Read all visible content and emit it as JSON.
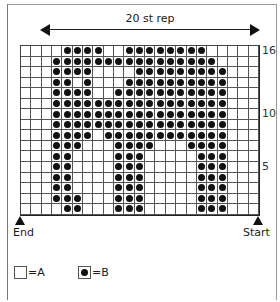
{
  "chart": {
    "repeat_label": "20 st rep",
    "columns": 23,
    "rows": 16,
    "row_labels": [
      {
        "row": 16,
        "text": "16"
      },
      {
        "row": 10,
        "text": "10"
      },
      {
        "row": 5,
        "text": "5"
      }
    ],
    "end_label": "End",
    "start_label": "Start"
  },
  "legend": {
    "a": {
      "symbol": "empty-square",
      "text": "=A"
    },
    "b": {
      "symbol": "dot-square",
      "text": "=B"
    }
  },
  "chart_data": {
    "type": "heatmap",
    "title": "20 st rep",
    "rows_B_columns": {
      "16": [
        5,
        6,
        7,
        8,
        11,
        12,
        13,
        14,
        15,
        16,
        17,
        18
      ],
      "15": [
        4,
        5,
        6,
        7,
        8,
        9,
        10,
        11,
        12,
        13,
        14,
        15,
        16,
        17,
        18,
        19
      ],
      "14": [
        4,
        5,
        6,
        7,
        12,
        13,
        14,
        15,
        16,
        17,
        18,
        19,
        20
      ],
      "13": [
        4,
        5,
        7,
        11,
        12,
        13,
        14,
        15,
        16,
        17,
        18,
        19,
        20
      ],
      "12": [
        4,
        5,
        6,
        7,
        10,
        11,
        12,
        13,
        14,
        15,
        16,
        17,
        18,
        19,
        20
      ],
      "11": [
        4,
        5,
        6,
        7,
        8,
        9,
        10,
        11,
        12,
        13,
        14,
        15,
        16,
        17,
        18,
        19,
        20
      ],
      "10": [
        4,
        5,
        6,
        7,
        8,
        9,
        10,
        11,
        12,
        13,
        14,
        15,
        16,
        17,
        18,
        19,
        20
      ],
      "9": [
        4,
        5,
        6,
        7,
        8,
        9,
        10,
        11,
        12,
        13,
        14,
        15,
        16,
        17,
        18,
        19,
        20
      ],
      "8": [
        4,
        5,
        6,
        7,
        9,
        10,
        11,
        12,
        13,
        14,
        15,
        16,
        17,
        18,
        19,
        20
      ],
      "7": [
        4,
        5,
        6,
        10,
        11,
        12,
        13,
        17,
        18,
        19,
        20
      ],
      "6": [
        4,
        5,
        10,
        11,
        12,
        18,
        19,
        20
      ],
      "5": [
        4,
        5,
        10,
        11,
        12,
        18,
        19,
        20
      ],
      "4": [
        4,
        5,
        10,
        11,
        12,
        18,
        19,
        20
      ],
      "3": [
        4,
        5,
        10,
        11,
        12,
        18,
        19,
        20
      ],
      "2": [
        4,
        5,
        6,
        10,
        11,
        12,
        18,
        19,
        20
      ],
      "1": [
        5,
        6,
        10,
        11,
        12,
        18,
        19,
        20
      ]
    },
    "ylabel_ticks": [
      "5",
      "10",
      "16"
    ],
    "legend": [
      "□ = A",
      "● = B"
    ],
    "annotations": [
      "20 st rep",
      "End",
      "Start"
    ]
  }
}
